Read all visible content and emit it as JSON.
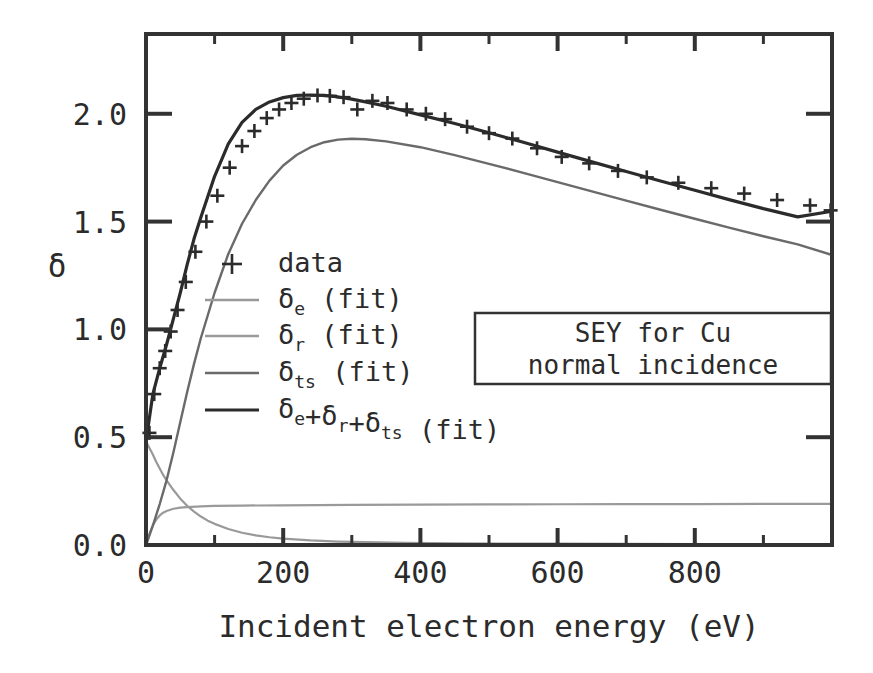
{
  "figure": {
    "background_color": "#ffffff",
    "frame_color": "#333333"
  },
  "annotation_box": {
    "line1": "SEY for Cu",
    "line2": "normal incidence"
  },
  "legend": {
    "entries": [
      {
        "kind": "marker",
        "label": "data",
        "sub": "",
        "tail": "",
        "color": "#2b2b2b"
      },
      {
        "kind": "line",
        "label": "δ",
        "sub": "e",
        "tail": " (fit)",
        "color": "#999999"
      },
      {
        "kind": "line",
        "label": "δ",
        "sub": "r",
        "tail": " (fit)",
        "color": "#9a9a9a"
      },
      {
        "kind": "line",
        "label": "δ",
        "sub": "ts",
        "tail": " (fit)",
        "color": "#6a6a6a"
      },
      {
        "kind": "line",
        "label": "δe+δr+δts",
        "sub": "",
        "tail": " (fit)",
        "color": "#2b2b2b"
      }
    ]
  },
  "chart_data": {
    "type": "line",
    "title": "",
    "xlabel": "Incident electron energy (eV)",
    "ylabel": "δ",
    "xlim": [
      0,
      1000
    ],
    "ylim": [
      0.0,
      2.37
    ],
    "xticks": [
      0,
      200,
      400,
      600,
      800
    ],
    "xtick_labels": [
      "0",
      "200",
      "400",
      "600",
      "800"
    ],
    "xticks_minor": [
      100,
      300,
      500,
      700,
      900
    ],
    "yticks": [
      0.0,
      0.5,
      1.0,
      1.5,
      2.0
    ],
    "ytick_labels": [
      "0.0",
      "0.5",
      "1.0",
      "1.5",
      "2.0"
    ],
    "grid": false,
    "legend_position": "center-left",
    "series": [
      {
        "name": "δe (fit)",
        "color": "#999999",
        "width": 2.2,
        "x": [
          0,
          5,
          10,
          15,
          20,
          25,
          30,
          40,
          50,
          60,
          70,
          80,
          90,
          100,
          120,
          140,
          160,
          180,
          200,
          240,
          280,
          320,
          380,
          450,
          520,
          600,
          700,
          800,
          900,
          1000
        ],
        "y": [
          0.48,
          0.45,
          0.42,
          0.385,
          0.355,
          0.325,
          0.3,
          0.255,
          0.215,
          0.182,
          0.155,
          0.132,
          0.113,
          0.098,
          0.074,
          0.057,
          0.045,
          0.036,
          0.03,
          0.021,
          0.016,
          0.013,
          0.01,
          0.008,
          0.007,
          0.006,
          0.005,
          0.004,
          0.004,
          0.003
        ]
      },
      {
        "name": "δr (fit)",
        "color": "#9a9a9a",
        "width": 2.2,
        "x": [
          0,
          5,
          10,
          15,
          20,
          25,
          30,
          40,
          50,
          60,
          80,
          100,
          140,
          200,
          300,
          400,
          500,
          600,
          700,
          800,
          900,
          1000
        ],
        "y": [
          0.0,
          0.052,
          0.092,
          0.118,
          0.137,
          0.15,
          0.158,
          0.168,
          0.173,
          0.176,
          0.179,
          0.181,
          0.183,
          0.184,
          0.186,
          0.187,
          0.188,
          0.189,
          0.19,
          0.19,
          0.191,
          0.191
        ]
      },
      {
        "name": "δts (fit)",
        "color": "#6a6a6a",
        "width": 2.4,
        "x": [
          0,
          10,
          20,
          30,
          40,
          50,
          60,
          70,
          80,
          100,
          120,
          140,
          160,
          180,
          200,
          220,
          240,
          260,
          280,
          300,
          320,
          350,
          400,
          450,
          500,
          550,
          600,
          650,
          700,
          750,
          800,
          850,
          900,
          950,
          1000
        ],
        "y": [
          0.0,
          0.09,
          0.19,
          0.3,
          0.43,
          0.57,
          0.71,
          0.84,
          0.96,
          1.17,
          1.35,
          1.49,
          1.6,
          1.69,
          1.76,
          1.81,
          1.845,
          1.868,
          1.88,
          1.884,
          1.882,
          1.872,
          1.845,
          1.808,
          1.768,
          1.726,
          1.683,
          1.64,
          1.597,
          1.555,
          1.513,
          1.472,
          1.432,
          1.394,
          1.345
        ]
      },
      {
        "name": "δe+δr+δts (fit)",
        "color": "#2b2b2b",
        "width": 3.2,
        "x": [
          0,
          10,
          20,
          30,
          40,
          50,
          60,
          70,
          80,
          100,
          120,
          140,
          160,
          180,
          200,
          220,
          240,
          260,
          280,
          300,
          320,
          350,
          400,
          450,
          500,
          550,
          600,
          650,
          700,
          750,
          800,
          850,
          900,
          950,
          1000
        ],
        "y": [
          0.48,
          0.7,
          0.82,
          0.93,
          1.05,
          1.17,
          1.3,
          1.42,
          1.52,
          1.71,
          1.86,
          1.96,
          2.02,
          2.055,
          2.075,
          2.085,
          2.087,
          2.085,
          2.078,
          2.068,
          2.055,
          2.035,
          1.995,
          1.955,
          1.912,
          1.868,
          1.822,
          1.777,
          1.732,
          1.688,
          1.645,
          1.602,
          1.56,
          1.522,
          1.548
        ]
      }
    ],
    "data_points": {
      "name": "data",
      "marker": "plus",
      "color": "#2b2b2b",
      "x": [
        5,
        12,
        20,
        28,
        36,
        46,
        58,
        72,
        88,
        104,
        122,
        140,
        158,
        176,
        194,
        212,
        230,
        250,
        268,
        288,
        308,
        330,
        352,
        380,
        408,
        436,
        468,
        500,
        534,
        570,
        606,
        646,
        688,
        730,
        776,
        824,
        872,
        920,
        968,
        998
      ],
      "y": [
        0.52,
        0.7,
        0.82,
        0.9,
        0.99,
        1.09,
        1.22,
        1.36,
        1.5,
        1.62,
        1.75,
        1.85,
        1.92,
        1.98,
        2.02,
        2.05,
        2.07,
        2.085,
        2.083,
        2.077,
        2.02,
        2.06,
        2.05,
        2.02,
        2.0,
        1.975,
        1.94,
        1.91,
        1.885,
        1.84,
        1.8,
        1.77,
        1.735,
        1.705,
        1.68,
        1.655,
        1.63,
        1.6,
        1.575,
        1.552
      ]
    }
  }
}
